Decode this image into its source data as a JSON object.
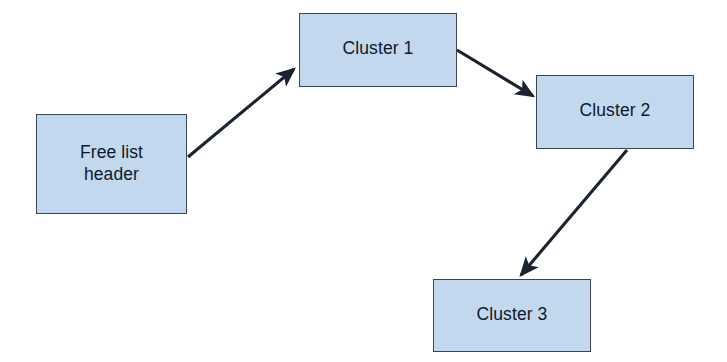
{
  "diagram": {
    "type": "flow-diagram",
    "background_color": "#ffffff",
    "node_fill_color": "#c2d8ef",
    "node_border_color": "#3a4455",
    "edge_color": "#1b2230",
    "text_color": "#101828",
    "nodes": [
      {
        "id": "free-list-header",
        "label": "Free list\nheader",
        "shape": "rectangle",
        "x": 36,
        "y": 114,
        "w": 151,
        "h": 100
      },
      {
        "id": "cluster-1",
        "label": "Cluster 1",
        "shape": "rectangle",
        "x": 299,
        "y": 13,
        "w": 158,
        "h": 74
      },
      {
        "id": "cluster-2",
        "label": "Cluster 2",
        "shape": "rectangle",
        "x": 536,
        "y": 75,
        "w": 158,
        "h": 74
      },
      {
        "id": "cluster-3",
        "label": "Cluster 3",
        "shape": "rectangle",
        "x": 433,
        "y": 279,
        "w": 158,
        "h": 73
      }
    ],
    "edges": [
      {
        "id": "edge-header-to-cluster1",
        "from": "free-list-header",
        "to": "cluster-1",
        "style": "solid",
        "arrowhead": "filled-triangle",
        "x1": 188,
        "y1": 157,
        "x2": 296,
        "y2": 67
      },
      {
        "id": "edge-cluster1-to-cluster2",
        "from": "cluster-1",
        "to": "cluster-2",
        "style": "solid",
        "arrowhead": "filled-triangle",
        "x1": 457,
        "y1": 50,
        "x2": 535,
        "y2": 98
      },
      {
        "id": "edge-cluster2-to-cluster3",
        "from": "cluster-2",
        "to": "cluster-3",
        "style": "solid",
        "arrowhead": "filled-triangle",
        "x1": 627,
        "y1": 150,
        "x2": 519,
        "y2": 277
      }
    ]
  }
}
